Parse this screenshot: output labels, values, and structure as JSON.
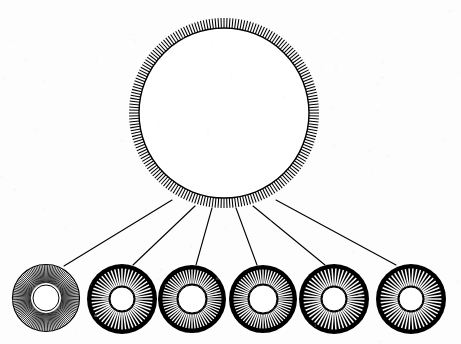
{
  "figure": {
    "background_color": "#fdfdfd",
    "ink_color": "#000000",
    "width": 461,
    "height": 344
  },
  "hub": {
    "name": "large-spoked-circle",
    "center_x": 224,
    "center_y": 113,
    "radius_outer": 95,
    "radius_inner": 85,
    "spoke_count": 200,
    "spoke_width": 1.05,
    "style": "black-spokes-on-white",
    "fill": "#ffffff",
    "stroke": "#000000"
  },
  "nodes": [
    {
      "name": "ring-1",
      "index": 1,
      "center_x": 46,
      "center_y": 298,
      "radius_outer": 34,
      "radius_inner": 15,
      "hole_radius": 13,
      "spoke_count": 120,
      "spoke_width": 0.85,
      "style": "light",
      "disc_fill": "#ffffff",
      "spoke_color": "#000000",
      "rim_stroke": "#000000",
      "rim_width": 1.2,
      "inner_ring_stroke": "#000000",
      "inner_ring_width": 1.0
    },
    {
      "name": "ring-2",
      "index": 2,
      "center_x": 122,
      "center_y": 299,
      "radius_outer": 35,
      "radius_inner": 13,
      "hole_radius": 12,
      "spoke_count": 52,
      "spoke_width": 1.5,
      "style": "dark",
      "disc_fill": "#000000",
      "spoke_color": "#ffffff",
      "rim_stroke": "#000000",
      "rim_width": 1.2,
      "inner_ring_stroke": "#000000",
      "inner_ring_width": 1.0
    },
    {
      "name": "ring-3",
      "index": 3,
      "center_x": 192,
      "center_y": 299,
      "radius_outer": 34,
      "radius_inner": 15,
      "hole_radius": 14,
      "spoke_count": 60,
      "spoke_width": 1.35,
      "style": "dark",
      "disc_fill": "#000000",
      "spoke_color": "#ffffff",
      "rim_stroke": "#000000",
      "rim_width": 1.2,
      "inner_ring_stroke": "#000000",
      "inner_ring_width": 1.0
    },
    {
      "name": "ring-4",
      "index": 4,
      "center_x": 263,
      "center_y": 299,
      "radius_outer": 34,
      "radius_inner": 15,
      "hole_radius": 14,
      "spoke_count": 60,
      "spoke_width": 1.35,
      "style": "dark",
      "disc_fill": "#000000",
      "spoke_color": "#ffffff",
      "rim_stroke": "#000000",
      "rim_width": 1.2,
      "inner_ring_stroke": "#000000",
      "inner_ring_width": 1.0
    },
    {
      "name": "ring-5",
      "index": 5,
      "center_x": 334,
      "center_y": 299,
      "radius_outer": 35,
      "radius_inner": 13,
      "hole_radius": 12,
      "spoke_count": 50,
      "spoke_width": 1.5,
      "style": "dark",
      "disc_fill": "#000000",
      "spoke_color": "#ffffff",
      "rim_stroke": "#000000",
      "rim_width": 1.2,
      "inner_ring_stroke": "#000000",
      "inner_ring_width": 1.0
    },
    {
      "name": "ring-6",
      "index": 6,
      "center_x": 411,
      "center_y": 299,
      "radius_outer": 35,
      "radius_inner": 13,
      "hole_radius": 12,
      "spoke_count": 50,
      "spoke_width": 1.5,
      "style": "dark",
      "disc_fill": "#000000",
      "spoke_color": "#ffffff",
      "rim_stroke": "#000000",
      "rim_width": 1.0,
      "inner_ring_stroke": "#000000",
      "inner_ring_width": 1.0
    }
  ],
  "connectors": [
    {
      "name": "connector-1",
      "from_index": 1,
      "hub_angle_deg": 123,
      "x1": 172,
      "y1": 200,
      "x2": 64,
      "y2": 266,
      "width": 1.1,
      "color": "#000000"
    },
    {
      "name": "connector-2",
      "from_index": 2,
      "hub_angle_deg": 108,
      "x1": 195,
      "y1": 206,
      "x2": 133,
      "y2": 265,
      "width": 1.1,
      "color": "#000000"
    },
    {
      "name": "connector-3",
      "from_index": 3,
      "hub_angle_deg": 97,
      "x1": 212,
      "y1": 208,
      "x2": 196,
      "y2": 265,
      "width": 1.1,
      "color": "#000000"
    },
    {
      "name": "connector-4",
      "from_index": 4,
      "hub_angle_deg": 83,
      "x1": 236,
      "y1": 208,
      "x2": 257,
      "y2": 265,
      "width": 1.1,
      "color": "#000000"
    },
    {
      "name": "connector-5",
      "from_index": 5,
      "hub_angle_deg": 72,
      "x1": 253,
      "y1": 206,
      "x2": 325,
      "y2": 265,
      "width": 1.1,
      "color": "#000000"
    },
    {
      "name": "connector-6",
      "from_index": 6,
      "hub_angle_deg": 57,
      "x1": 276,
      "y1": 200,
      "x2": 396,
      "y2": 265,
      "width": 1.1,
      "color": "#000000"
    }
  ]
}
